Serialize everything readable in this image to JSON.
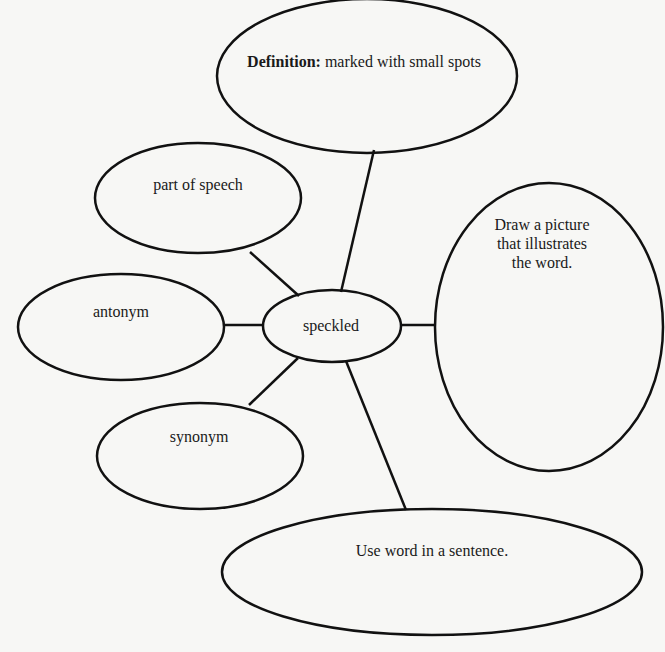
{
  "diagram": {
    "type": "vocabulary-word-map",
    "center": {
      "id": "word",
      "label": "speckled"
    },
    "nodes": [
      {
        "id": "definition",
        "label_bold": "Definition:",
        "label": "marked with small spots"
      },
      {
        "id": "part-of-speech",
        "label": "part of speech"
      },
      {
        "id": "antonym",
        "label": "antonym"
      },
      {
        "id": "synonym",
        "label": "synonym"
      },
      {
        "id": "picture",
        "lines": [
          "Draw a picture",
          "that illustrates",
          "the word."
        ]
      },
      {
        "id": "sentence",
        "label": "Use word in a sentence."
      }
    ],
    "edges": [
      [
        "word",
        "definition"
      ],
      [
        "word",
        "part-of-speech"
      ],
      [
        "word",
        "antonym"
      ],
      [
        "word",
        "synonym"
      ],
      [
        "word",
        "picture"
      ],
      [
        "word",
        "sentence"
      ]
    ],
    "colors": {
      "stroke": "#111111",
      "background": "#f7f7f5",
      "text": "#1a1a1a"
    }
  }
}
